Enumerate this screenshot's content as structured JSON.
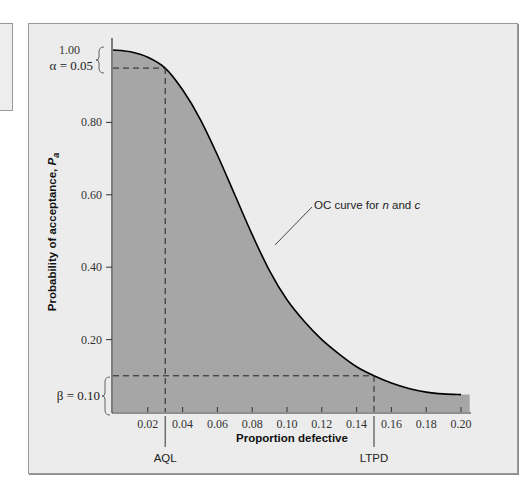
{
  "chart_data": {
    "type": "area",
    "title": "",
    "xlabel": "Proportion defective",
    "ylabel": "Probability of acceptance, P_a",
    "ylabel_main": "Probability of acceptance, ",
    "ylabel_symbol": "P",
    "ylabel_subscript": "a",
    "xlim": [
      0,
      0.205
    ],
    "ylim": [
      0,
      1.0
    ],
    "x_ticks": [
      "0.02",
      "0.04",
      "0.06",
      "0.08",
      "0.10",
      "0.12",
      "0.14",
      "0.16",
      "0.18",
      "0.20"
    ],
    "y_ticks": [
      "0.20",
      "0.40",
      "0.60",
      "0.80",
      "1.00"
    ],
    "grid": false,
    "series": [
      {
        "name": "OC curve for n and c",
        "x": [
          0.0,
          0.01,
          0.02,
          0.03,
          0.04,
          0.05,
          0.06,
          0.07,
          0.08,
          0.09,
          0.1,
          0.11,
          0.12,
          0.13,
          0.14,
          0.15,
          0.16,
          0.17,
          0.18,
          0.19,
          0.2
        ],
        "values": [
          1.0,
          0.995,
          0.98,
          0.95,
          0.89,
          0.81,
          0.71,
          0.6,
          0.49,
          0.39,
          0.31,
          0.25,
          0.2,
          0.16,
          0.125,
          0.1,
          0.08,
          0.065,
          0.055,
          0.05,
          0.048
        ]
      }
    ],
    "annotations": {
      "curve_label": "OC curve for n and c",
      "curve_label_prefix": "OC curve for ",
      "curve_label_n": "n",
      "curve_label_and": " and ",
      "curve_label_c": "c",
      "alpha_label": "α = 0.05",
      "beta_label": "β = 0.10",
      "aql_label": "AQL",
      "ltpd_label": "LTPD",
      "aql_x": 0.03,
      "ltpd_x": 0.15,
      "alpha_y": 0.95,
      "beta_y": 0.1
    },
    "colors": {
      "fill": "#a6a6a6",
      "curve": "#000000",
      "panel_bg": "#ececec",
      "border": "#9a9a9a"
    }
  }
}
